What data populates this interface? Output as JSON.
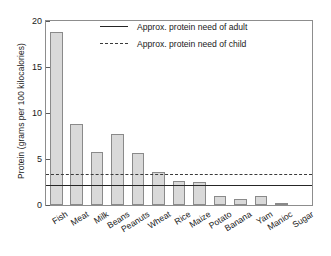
{
  "chart_data": {
    "type": "bar",
    "title": "",
    "subtitle": "",
    "xlabel": "",
    "ylabel": "Protein (grams per 100 kilocalories)",
    "ylim": [
      0,
      20
    ],
    "yticks": [
      0,
      5,
      10,
      15,
      20
    ],
    "ytick_labels": [
      "0",
      "5",
      "10",
      "15",
      "20"
    ],
    "grid": false,
    "legend_position": "top-center",
    "categories": [
      "Fish",
      "Meat",
      "Milk",
      "Beans",
      "Peanuts",
      "Wheat",
      "Rice",
      "Maize",
      "Potato",
      "Banana",
      "Yam",
      "Manioc",
      "Sugar"
    ],
    "values": [
      18.8,
      8.8,
      5.8,
      7.7,
      5.7,
      3.6,
      2.6,
      2.5,
      1.0,
      0.6,
      1.0,
      0.2,
      0.0
    ],
    "bar_fill_color": "#d9d9d9",
    "bar_edge_color": "#8a8a8a",
    "reference_lines": [
      {
        "id": "adult",
        "label": "Approx. protein need of adult",
        "value": 2.2,
        "style": "solid",
        "color": "#262626"
      },
      {
        "id": "child",
        "label": "Approx. protein need of child",
        "value": 3.4,
        "style": "dashed",
        "color": "#3a3a3a"
      }
    ]
  }
}
